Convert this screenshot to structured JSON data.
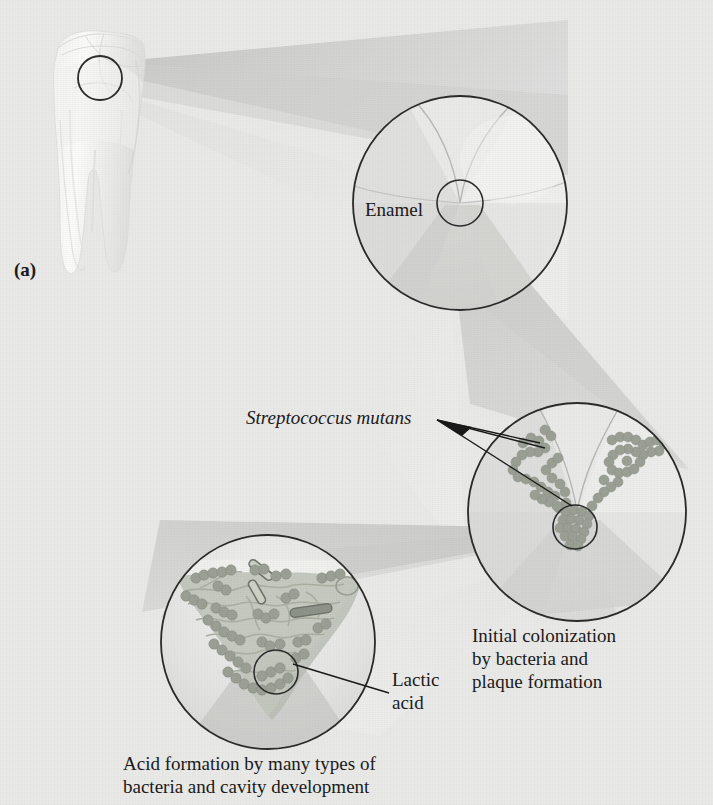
{
  "figure": {
    "panel_label": "(a)",
    "background_color": "#e9e9e7",
    "outline_color": "#2b2b2b",
    "bacteria_color": "#9a9e94",
    "plaque_color": "#b9bdb2"
  },
  "labels": {
    "enamel": "Enamel",
    "streptococcus": "Streptococcus mutans",
    "lactic_acid": "Lactic\nacid"
  },
  "captions": {
    "initial_colonization": "Initial colonization\nby bacteria and\nplaque formation",
    "acid_formation": "Acid formation by many types of\nbacteria and cavity development"
  },
  "magnification_steps": [
    {
      "id": "whole-tooth",
      "name": "Whole molar tooth",
      "center": [
        100,
        78
      ],
      "detail_radius": 22,
      "description": "Intact molar with two roots; circled region marks enamel surface fissure"
    },
    {
      "id": "enamel-surface",
      "name": "Enamel surface magnification",
      "center": [
        460,
        203
      ],
      "radius": 108,
      "detail_center": [
        460,
        203
      ],
      "detail_radius": 23,
      "label": "Enamel",
      "description": "Three-way enamel rod junction meeting at a central fissure"
    },
    {
      "id": "colonization",
      "name": "Bacterial colonization magnification",
      "center": [
        577,
        512
      ],
      "radius": 110,
      "detail_center": [
        575,
        527
      ],
      "detail_radius": 22,
      "label": "Streptococcus mutans",
      "caption": "Initial colonization by bacteria and plaque formation",
      "description": "Chains of cocci lining the V-shaped enamel fissure"
    },
    {
      "id": "cavity",
      "name": "Acid formation and cavity magnification",
      "center": [
        268,
        642
      ],
      "radius": 108,
      "detail_center": [
        276,
        672
      ],
      "detail_radius": 22,
      "label": "Lactic acid",
      "caption": "Acid formation by many types of bacteria and cavity development",
      "description": "Dense plaque biofilm with cocci, rods and filaments eroding enamel"
    }
  ]
}
